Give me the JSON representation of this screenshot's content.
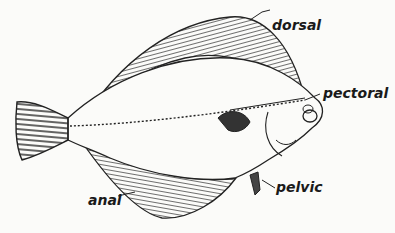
{
  "figure": {
    "labels": {
      "dorsal": "dorsal",
      "pectoral": "pectoral",
      "pelvic": "pelvic",
      "anal": "anal"
    }
  }
}
